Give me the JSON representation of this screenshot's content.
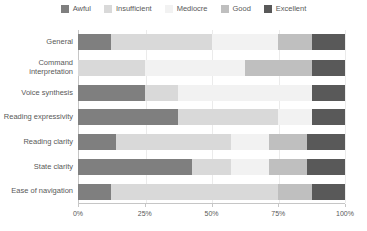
{
  "chart_data": {
    "type": "bar",
    "orientation": "horizontal",
    "stacked": true,
    "unit": "percent",
    "title": "",
    "xlabel": "",
    "ylabel": "",
    "xlim": [
      0,
      100
    ],
    "grid": true,
    "legend_position": "top",
    "categories": [
      "General",
      "Command interpretation",
      "Voice synthesis",
      "Reading expressivity",
      "Reading clarity",
      "State clarity",
      "Ease of navigation"
    ],
    "series": [
      {
        "name": "Awful",
        "color": "#7f7f7f",
        "values": [
          12.5,
          0,
          25,
          37.5,
          14.3,
          42.9,
          12.5
        ]
      },
      {
        "name": "Insufficient",
        "color": "#d9d9d9",
        "values": [
          37.5,
          25,
          12.5,
          37.5,
          42.9,
          14.3,
          62.5
        ]
      },
      {
        "name": "Mediocre",
        "color": "#f2f2f2",
        "values": [
          25,
          37.5,
          50,
          12.5,
          14.3,
          14.3,
          0
        ]
      },
      {
        "name": "Good",
        "color": "#bfbfbf",
        "values": [
          12.5,
          25,
          0,
          0,
          14.3,
          14.3,
          12.5
        ]
      },
      {
        "name": "Excellent",
        "color": "#595959",
        "values": [
          12.5,
          12.5,
          12.5,
          12.5,
          14.3,
          14.3,
          12.5
        ]
      }
    ],
    "x_ticks": [
      "0%",
      "25%",
      "50%",
      "75%",
      "100%"
    ],
    "x_tick_positions": [
      0,
      25,
      50,
      75,
      100
    ],
    "gridline_positions": [
      25,
      50,
      75,
      100
    ]
  },
  "colors": {
    "background": "#ffffff",
    "axis": "#c6c6c6",
    "gridline": "#ebebeb",
    "text": "#595959"
  }
}
